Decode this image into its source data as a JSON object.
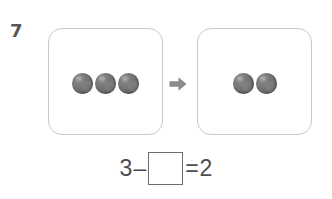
{
  "problem": {
    "number": "7",
    "type": "subtraction-visual-model"
  },
  "groups": [
    {
      "name": "before-group",
      "count": 3,
      "object_label": "marble",
      "object_color": "#6e6e70"
    },
    {
      "name": "after-group",
      "count": 2,
      "object_label": "marble",
      "object_color": "#6e6e70"
    }
  ],
  "transition": {
    "icon": "arrow-right-icon",
    "color": "#8c8c8e"
  },
  "equation": {
    "left_operand": "3",
    "operator": "–",
    "answer_box_value": "",
    "equals": "=",
    "result": "2"
  },
  "colors": {
    "box_border": "#c9c9cb",
    "answer_box_border": "#6d6d6f",
    "text": "#4d4d4f",
    "number_label": "#58585a",
    "page_background": "#ffffff"
  }
}
